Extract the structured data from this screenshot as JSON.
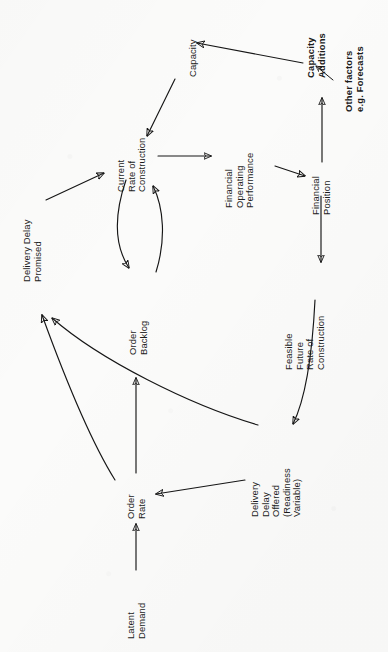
{
  "figure": {
    "kind": "causal-loop-diagram",
    "orientation": "rotated-90-counterclockwise",
    "background_color": "#fbfbfa",
    "ink_color": "#161616"
  },
  "nodes": {
    "capacity": {
      "lines": [
        "Capacity"
      ],
      "bold": false
    },
    "capacity_additions": {
      "lines": [
        "Capacity",
        "Additions"
      ],
      "bold": true
    },
    "other_factors": {
      "lines": [
        "Other factors",
        "e.g. Forecasts"
      ],
      "bold": true
    },
    "current_rate": {
      "lines": [
        "Current",
        "Rate of",
        "Construction"
      ],
      "bold": false
    },
    "financial_operating": {
      "lines": [
        "Financial",
        "Operating",
        "Performance"
      ],
      "bold": false
    },
    "financial_position": {
      "lines": [
        "Financial",
        "Position"
      ],
      "bold": false
    },
    "delivery_delay_promised": {
      "lines": [
        "Delivery Delay",
        "Promised"
      ],
      "bold": false
    },
    "order_backlog": {
      "lines": [
        "Order",
        "Backlog"
      ],
      "bold": false
    },
    "feasible_future_rate": {
      "lines": [
        "Feasible",
        "Future",
        "Rate of",
        "Construction"
      ],
      "bold": false
    },
    "delivery_delay_offered": {
      "lines": [
        "Delivery",
        "Delay",
        "Offered",
        "(Readiness",
        "Variable)"
      ],
      "bold": false
    },
    "order_rate": {
      "lines": [
        "Order",
        "Rate"
      ],
      "bold": false
    },
    "latent_demand": {
      "lines": [
        "Latent",
        "Demand"
      ],
      "bold": false
    }
  },
  "edges": [
    {
      "name": "capacity-additions-to-capacity",
      "from": "capacity_additions",
      "to": "capacity",
      "style": "straight"
    },
    {
      "name": "other-factors-to-capacity-additions",
      "from": "other_factors",
      "to": "capacity_additions",
      "style": "straight-short"
    },
    {
      "name": "financial-position-to-capacity-additions",
      "from": "financial_position",
      "to": "capacity_additions",
      "style": "straight"
    },
    {
      "name": "capacity-to-current-rate",
      "from": "capacity",
      "to": "current_rate",
      "style": "straight"
    },
    {
      "name": "current-rate-to-financial-operating",
      "from": "current_rate",
      "to": "financial_operating",
      "style": "straight"
    },
    {
      "name": "financial-operating-to-financial-position",
      "from": "financial_operating",
      "to": "financial_position",
      "style": "straight"
    },
    {
      "name": "financial-position-to-feasible-future-rate",
      "from": "financial_position",
      "to": "feasible_future_rate",
      "style": "straight"
    },
    {
      "name": "feasible-future-rate-to-delivery-delay-offered",
      "from": "feasible_future_rate",
      "to": "delivery_delay_offered",
      "style": "curved"
    },
    {
      "name": "current-rate-to-order-backlog",
      "from": "current_rate",
      "to": "order_backlog",
      "style": "curved"
    },
    {
      "name": "order-backlog-to-current-rate",
      "from": "order_backlog",
      "to": "current_rate",
      "style": "curved"
    },
    {
      "name": "delivery-delay-promised-to-current-rate",
      "from": "delivery_delay_promised",
      "to": "current_rate",
      "style": "straight"
    },
    {
      "name": "order-rate-to-order-backlog",
      "from": "order_rate",
      "to": "order_backlog",
      "style": "straight"
    },
    {
      "name": "order-rate-to-delivery-delay-promised",
      "from": "order_rate",
      "to": "delivery_delay_promised",
      "style": "curved-long"
    },
    {
      "name": "delivery-delay-offered-to-delivery-delay-promised",
      "from": "delivery_delay_offered",
      "to": "delivery_delay_promised",
      "style": "curved-long"
    },
    {
      "name": "delivery-delay-offered-to-order-rate",
      "from": "delivery_delay_offered",
      "to": "order_rate",
      "style": "straight"
    },
    {
      "name": "latent-demand-to-order-rate",
      "from": "latent_demand",
      "to": "order_rate",
      "style": "straight"
    }
  ]
}
